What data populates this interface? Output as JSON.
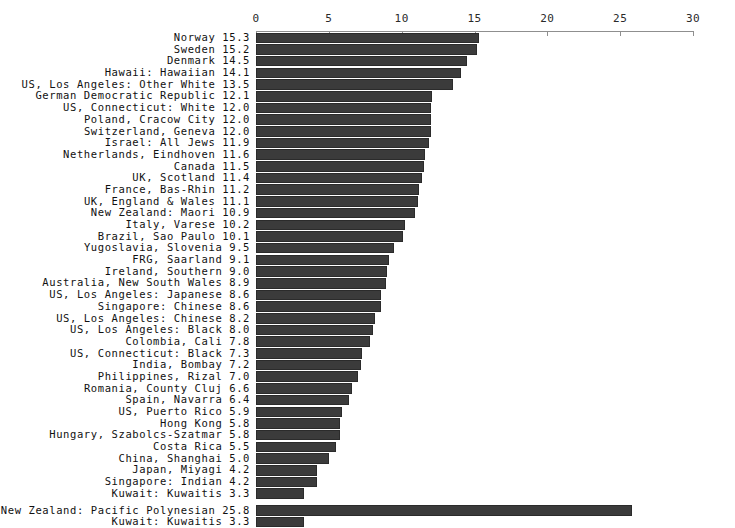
{
  "chart_data": {
    "type": "bar",
    "orientation": "horizontal",
    "title": "",
    "subtitle": "",
    "xlabel": "",
    "ylabel": "",
    "xlim": [
      0,
      30
    ],
    "grid": false,
    "legend": null,
    "tick_labels": [
      "0",
      "5",
      "10",
      "15",
      "20",
      "25",
      "30"
    ],
    "tick_values": [
      0,
      5,
      10,
      15,
      20,
      25,
      30
    ],
    "bar_color": "#3b3b3b",
    "axis_color": "#8f8f8f",
    "background_color": "#ffffff",
    "groups": [
      {
        "name": "main",
        "categories": [
          "Norway",
          "Sweden",
          "Denmark",
          "Hawaii: Hawaiian",
          "US, Los Angeles: Other White",
          "German Democratic Republic",
          "US, Connecticut: White",
          "Poland, Cracow City",
          "Switzerland, Geneva",
          "Israel: All Jews",
          "Netherlands, Eindhoven",
          "Canada",
          "UK, Scotland",
          "France, Bas-Rhin",
          "UK, England & Wales",
          "New Zealand: Maori",
          "Italy, Varese",
          "Brazil, Sao Paulo",
          "Yugoslavia, Slovenia",
          "FRG, Saarland",
          "Ireland, Southern",
          "Australia, New South Wales",
          "US, Los Angeles: Japanese",
          "Singapore: Chinese",
          "US, Los Angeles: Chinese",
          "US, Los Angeles: Black",
          "Colombia, Cali",
          "US, Connecticut: Black",
          "India, Bombay",
          "Philippines, Rizal",
          "Romania, County Cluj",
          "Spain, Navarra",
          "US, Puerto Rico",
          "Hong Kong",
          "Hungary, Szabolcs-Szatmar",
          "Costa Rica",
          "China, Shanghai",
          "Japan, Miyagi",
          "Singapore: Indian",
          "Kuwait: Kuwaitis"
        ],
        "values": [
          15.3,
          15.2,
          14.5,
          14.1,
          13.5,
          12.1,
          12.0,
          12.0,
          12.0,
          11.9,
          11.6,
          11.5,
          11.4,
          11.2,
          11.1,
          10.9,
          10.2,
          10.1,
          9.5,
          9.1,
          9.0,
          8.9,
          8.6,
          8.6,
          8.2,
          8.0,
          7.8,
          7.3,
          7.2,
          7.0,
          6.6,
          6.4,
          5.9,
          5.8,
          5.8,
          5.5,
          5.0,
          4.2,
          4.2,
          3.3
        ],
        "value_labels": [
          "15.3",
          "15.2",
          "14.5",
          "14.1",
          "13.5",
          "12.1",
          "12.0",
          "12.0",
          "12.0",
          "11.9",
          "11.6",
          "11.5",
          "11.4",
          "11.2",
          "11.1",
          "10.9",
          "10.2",
          "10.1",
          "9.5",
          "9.1",
          "9.0",
          "8.9",
          "8.6",
          "8.6",
          "8.2",
          "8.0",
          "7.8",
          "7.3",
          "7.2",
          "7.0",
          "6.6",
          "6.4",
          "5.9",
          "5.8",
          "5.8",
          "5.5",
          "5.0",
          "4.2",
          "4.2",
          "3.3"
        ]
      },
      {
        "name": "extremes",
        "categories": [
          "New Zealand: Pacific Polynesian",
          "Kuwait: Kuwaitis"
        ],
        "values": [
          25.8,
          3.3
        ],
        "value_labels": [
          "25.8",
          "3.3"
        ]
      }
    ]
  }
}
